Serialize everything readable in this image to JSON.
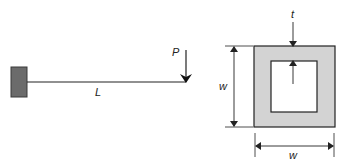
{
  "diagram": {
    "beam": {
      "load_label": "P",
      "length_label": "L",
      "support": "fixed-wall",
      "load_direction": "down"
    },
    "cross_section": {
      "shape": "hollow-square",
      "thickness_label": "t",
      "height_label": "w",
      "width_label": "w"
    },
    "colors": {
      "wall_fill": "#6b6b6b",
      "wall_stroke": "#3a3a3a",
      "section_fill": "#d3d3d3",
      "line": "#222222"
    }
  }
}
